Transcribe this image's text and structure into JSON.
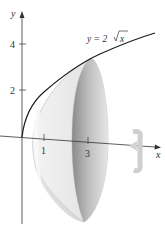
{
  "figure": {
    "equation": {
      "prefix": "y = 2",
      "radicand": "x"
    },
    "axes": {
      "x_label": "x",
      "y_label": "y",
      "y_ticks": [
        {
          "label": "4",
          "value": 4
        },
        {
          "label": "2",
          "value": 2
        }
      ],
      "x_ticks": [
        {
          "label": "1",
          "value": 1
        },
        {
          "label": "3",
          "value": 3
        }
      ]
    },
    "rotation_icon": "rotation-arrow-icon",
    "colors": {
      "curve": "#1a1a1a",
      "axis": "#333333",
      "solid_light": "#eeeeee",
      "solid_dark": "#b5b5b5",
      "rotation_arrow": "#c8c8c8"
    }
  }
}
